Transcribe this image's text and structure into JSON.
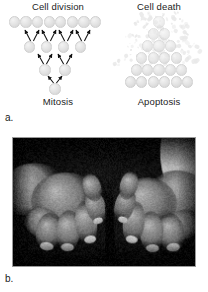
{
  "figure": {
    "part_a_letter": "a.",
    "part_b_letter": "b."
  },
  "panel_a": {
    "left_title": "Cell division",
    "left_caption": "Mitosis",
    "right_title": "Cell death",
    "right_caption": "Apoptosis",
    "colors": {
      "cell_fill": "#e4e4e4",
      "cell_edge": "#cfcfcf",
      "arrow": "#111111",
      "text": "#1c1c1c",
      "background": "#ffffff"
    },
    "mitosis_diagram": {
      "description": "Inverted pyramid of cells showing one cell dividing into two, then four, then eight",
      "rows": [
        {
          "count": 8,
          "y": 22,
          "radius": 5.6,
          "spacing": 11.6,
          "center_x": 55
        },
        {
          "count": 4,
          "y": 47,
          "radius": 5.6,
          "spacing": 17.0,
          "center_x": 55
        },
        {
          "count": 2,
          "y": 70,
          "radius": 5.6,
          "spacing": 20.0,
          "center_x": 55
        },
        {
          "count": 1,
          "y": 89,
          "radius": 5.6,
          "spacing": 0,
          "center_x": 55
        }
      ],
      "arrow_pairs": [
        {
          "from_x": 55,
          "from_y": 83,
          "spread": 7,
          "to_y": 76
        },
        {
          "from_x": 45,
          "from_y": 64,
          "spread": 7,
          "to_y": 54
        },
        {
          "from_x": 65,
          "from_y": 64,
          "spread": 7,
          "to_y": 54
        },
        {
          "from_x": 32,
          "from_y": 41,
          "spread": 7,
          "to_y": 30
        },
        {
          "from_x": 49,
          "from_y": 41,
          "spread": 7,
          "to_y": 30
        },
        {
          "from_x": 66,
          "from_y": 41,
          "spread": 7,
          "to_y": 30
        },
        {
          "from_x": 83,
          "from_y": 41,
          "spread": 7,
          "to_y": 30
        }
      ]
    },
    "apoptosis_diagram": {
      "description": "Pyramid of cells whose upper rows are fragmenting into small apoptotic bodies",
      "rows": [
        {
          "count": 1,
          "y": 12,
          "radius": 5.6,
          "spacing": 11.4,
          "center_x": 49
        },
        {
          "count": 2,
          "y": 24,
          "radius": 5.6,
          "spacing": 11.4,
          "center_x": 49
        },
        {
          "count": 3,
          "y": 36,
          "radius": 5.6,
          "spacing": 11.4,
          "center_x": 49
        },
        {
          "count": 4,
          "y": 48,
          "radius": 5.6,
          "spacing": 11.4,
          "center_x": 49
        },
        {
          "count": 5,
          "y": 60,
          "radius": 5.6,
          "spacing": 11.4,
          "center_x": 49
        },
        {
          "count": 6,
          "y": 72,
          "radius": 5.6,
          "spacing": 11.4,
          "center_x": 49
        }
      ],
      "debris_count": 150
    }
  },
  "panel_b": {
    "description": "Black-and-white photograph of a child's two hands on a dark background showing syndactyly, the fingers of both hands fused and shortened, with a white shirt cuff visible at the upper right",
    "background_color": "#050505",
    "border_color": "#9a9a9a"
  }
}
